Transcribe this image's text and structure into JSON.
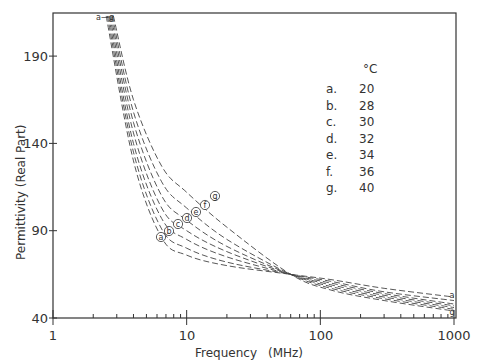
{
  "chart_data": {
    "type": "line",
    "title": "",
    "xlabel": "Frequency (MHz)",
    "ylabel": "Permittivity (Real Part)",
    "xscale": "log",
    "xlim": [
      1,
      1000
    ],
    "ylim": [
      40,
      215
    ],
    "xticks": [
      "1",
      "10",
      "100",
      "1000"
    ],
    "yticks": [
      "40",
      "90",
      "140",
      "190"
    ],
    "grid": false,
    "legend": {
      "header": "°C",
      "position": "upper right",
      "entries": [
        {
          "key": "a.",
          "value": "20"
        },
        {
          "key": "b.",
          "value": "28"
        },
        {
          "key": "c.",
          "value": "30"
        },
        {
          "key": "d.",
          "value": "32"
        },
        {
          "key": "e.",
          "value": "34"
        },
        {
          "key": "f.",
          "value": "36"
        },
        {
          "key": "g.",
          "value": "40"
        }
      ]
    },
    "line_style": "dashed",
    "x": [
      2.5,
      4,
      6.5,
      10,
      20,
      60,
      120,
      300,
      1000
    ],
    "series": [
      {
        "name": "a",
        "temp_C": 20,
        "values": [
          213,
          130,
          86,
          76,
          70,
          65,
          62,
          57,
          52
        ]
      },
      {
        "name": "b",
        "temp_C": 28,
        "values": [
          213,
          135,
          91,
          80,
          72,
          65,
          61,
          55,
          50
        ]
      },
      {
        "name": "c",
        "temp_C": 30,
        "values": [
          213,
          140,
          97,
          85,
          75,
          65,
          60,
          54,
          48
        ]
      },
      {
        "name": "d",
        "temp_C": 32,
        "values": [
          213,
          146,
          103,
          90,
          78,
          65,
          59,
          53,
          47
        ]
      },
      {
        "name": "e",
        "temp_C": 34,
        "values": [
          213,
          152,
          110,
          96,
          81,
          65,
          58,
          52,
          46
        ]
      },
      {
        "name": "f",
        "temp_C": 36,
        "values": [
          213,
          158,
          118,
          103,
          85,
          65,
          57,
          51,
          45
        ]
      },
      {
        "name": "g",
        "temp_C": 40,
        "values": [
          213,
          165,
          127,
          112,
          92,
          65,
          56,
          50,
          44
        ]
      }
    ],
    "annotations": [
      {
        "text": "a—g",
        "at": "curve starts, ~2.5 MHz, top"
      },
      {
        "text": "a–g circled labels",
        "at": "~6–16 MHz along curves"
      },
      {
        "text": "a–g",
        "at": "curve ends at 1000 MHz, right edge"
      }
    ]
  },
  "axes": {
    "xlabel": "Frequency",
    "xunit": "(MHz)",
    "ylabel": "Permittivity (Real Part)",
    "xticks": [
      "1",
      "10",
      "100",
      "1000"
    ],
    "yticks": [
      "40",
      "90",
      "140",
      "190"
    ]
  },
  "legend": {
    "header": "°C",
    "entries": [
      {
        "key": "a.",
        "value": "20"
      },
      {
        "key": "b.",
        "value": "28"
      },
      {
        "key": "c.",
        "value": "30"
      },
      {
        "key": "d.",
        "value": "32"
      },
      {
        "key": "e.",
        "value": "34"
      },
      {
        "key": "f.",
        "value": "36"
      },
      {
        "key": "g.",
        "value": "40"
      }
    ]
  },
  "curve_labels": [
    "a",
    "b",
    "c",
    "d",
    "e",
    "f",
    "g"
  ],
  "top_marker": "a—g"
}
